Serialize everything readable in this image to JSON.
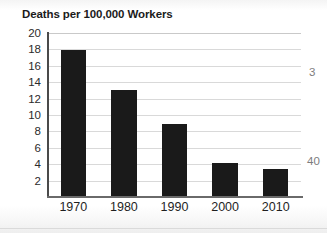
{
  "chart_data": {
    "type": "bar",
    "title": "Deaths per 100,000 Workers",
    "xlabel": "",
    "ylabel": "",
    "categories": [
      "1970",
      "1980",
      "1990",
      "2000",
      "2010"
    ],
    "values": [
      17.9,
      13.0,
      8.9,
      4.2,
      3.4
    ],
    "ylim": [
      0,
      20
    ],
    "ytick_labels": [
      "20",
      "18",
      "16",
      "14",
      "12",
      "10",
      "8",
      "6",
      "4",
      "2"
    ],
    "ytick_values": [
      20,
      18,
      16,
      14,
      12,
      10,
      8,
      6,
      4,
      2
    ],
    "grid": "horizontal",
    "legend": "none",
    "bar_color": "#1a1a1a",
    "grid_color": "#d9d9d9",
    "axis_color": "#4a4a4a",
    "background_color": "#ffffff"
  },
  "margin_fragments": {
    "top": "3",
    "bottom": "40"
  }
}
